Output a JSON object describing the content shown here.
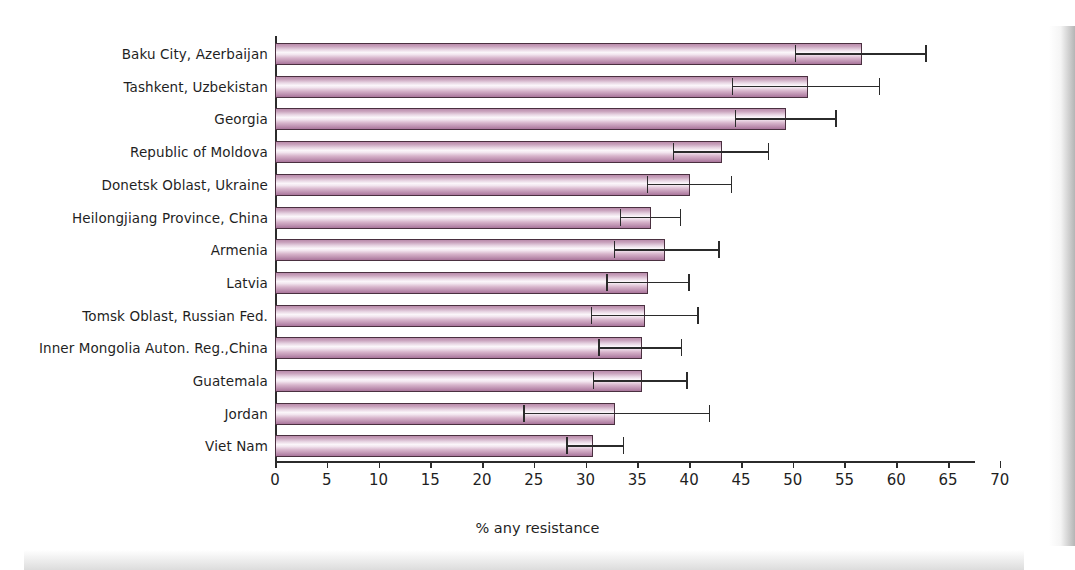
{
  "chart_data": {
    "type": "bar",
    "orientation": "horizontal",
    "title": "",
    "xlabel": "% any resistance",
    "ylabel": "",
    "xlim": [
      0,
      70
    ],
    "xticks": [
      0,
      5,
      10,
      15,
      20,
      25,
      30,
      35,
      40,
      45,
      50,
      55,
      60,
      65,
      70
    ],
    "grid": false,
    "legend": null,
    "error_bars": "95% confidence interval",
    "categories": [
      "Baku City, Azerbaijan",
      "Tashkent, Uzbekistan",
      "Georgia",
      "Republic of Moldova",
      "Donetsk Oblast, Ukraine",
      "Heilongjiang Province, China",
      "Armenia",
      "Latvia",
      "Tomsk Oblast, Russian Fed.",
      "Inner Mongolia Auton. Reg.,China",
      "Guatemala",
      "Jordan",
      "Viet Nam"
    ],
    "values": [
      56.7,
      51.5,
      49.4,
      43.2,
      40.1,
      36.3,
      37.7,
      36.0,
      35.7,
      35.4,
      35.4,
      32.8,
      30.7
    ],
    "err_low": [
      50.2,
      44.1,
      44.4,
      38.4,
      35.9,
      33.3,
      32.7,
      32.0,
      30.5,
      31.2,
      30.7,
      24.0,
      28.1
    ],
    "err_high": [
      62.8,
      58.3,
      54.1,
      47.6,
      44.0,
      39.1,
      42.8,
      39.9,
      40.8,
      39.2,
      39.7,
      41.9,
      33.6
    ],
    "bar_color": "#d7b4cb",
    "bar_edge_color": "#4a3040",
    "axis_color": "#2b2b2b"
  }
}
